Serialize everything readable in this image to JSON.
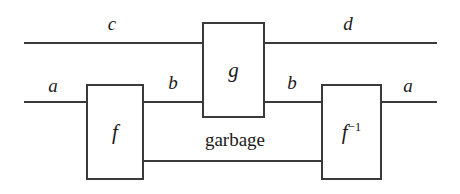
{
  "diagram": {
    "kind": "string-diagram",
    "title": "",
    "colors": {
      "background": "#ffffff",
      "wire": "#3a3a3a",
      "box_border": "#3a3a3a",
      "box_fill": "#ffffff",
      "text": "#1a1a1a"
    },
    "boxes": [
      {
        "id": "f",
        "label": "f",
        "exponent": ""
      },
      {
        "id": "g",
        "label": "g",
        "exponent": ""
      },
      {
        "id": "finv",
        "label": "f",
        "exponent": "−1"
      }
    ],
    "wire_labels": {
      "top_left": "c",
      "top_right": "d",
      "mid_left": "a",
      "mid_inner_left": "b",
      "mid_inner_right": "b",
      "mid_right": "a"
    },
    "annotations": {
      "garbage": "garbage"
    }
  }
}
